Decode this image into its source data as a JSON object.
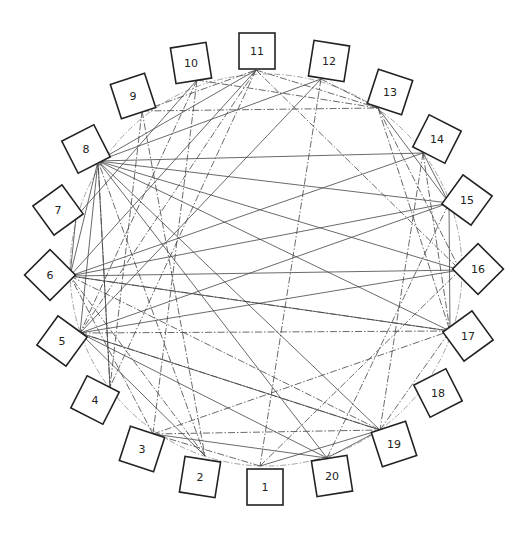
{
  "diagram": {
    "type": "circular-network",
    "colors": {
      "line": "#444444",
      "box_stroke": "#222222",
      "background": "#ffffff"
    },
    "center": [
      266,
      270
    ],
    "radius": 196,
    "nodes": [
      {
        "id": "1",
        "label": "1",
        "anchor": [
          260,
          466
        ],
        "box": [
          265,
          487
        ],
        "rot": 0
      },
      {
        "id": "2",
        "label": "2",
        "anchor": [
          205,
          456
        ],
        "box": [
          200,
          477
        ],
        "rot": 18
      },
      {
        "id": "3",
        "label": "3",
        "anchor": [
          153,
          434
        ],
        "box": [
          142,
          449
        ],
        "rot": 36
      },
      {
        "id": "4",
        "label": "4",
        "anchor": [
          110,
          387
        ],
        "box": [
          95,
          400
        ],
        "rot": 54
      },
      {
        "id": "5",
        "label": "5",
        "anchor": [
          80,
          333
        ],
        "box": [
          62,
          341
        ],
        "rot": 72
      },
      {
        "id": "6",
        "label": "6",
        "anchor": [
          70,
          276
        ],
        "box": [
          50,
          275
        ],
        "rot": 90
      },
      {
        "id": "7",
        "label": "7",
        "anchor": [
          76,
          217
        ],
        "box": [
          58,
          210
        ],
        "rot": 108
      },
      {
        "id": "8",
        "label": "8",
        "anchor": [
          98,
          161
        ],
        "box": [
          86,
          149
        ],
        "rot": 126
      },
      {
        "id": "9",
        "label": "9",
        "anchor": [
          142,
          111
        ],
        "box": [
          133,
          96
        ],
        "rot": 144
      },
      {
        "id": "10",
        "label": "10",
        "anchor": [
          197,
          80
        ],
        "box": [
          191,
          63
        ],
        "rot": 162
      },
      {
        "id": "11",
        "label": "11",
        "anchor": [
          256,
          70
        ],
        "box": [
          257,
          51
        ],
        "rot": 180
      },
      {
        "id": "12",
        "label": "12",
        "anchor": [
          321,
          79
        ],
        "box": [
          329,
          61
        ],
        "rot": 198
      },
      {
        "id": "13",
        "label": "13",
        "anchor": [
          378,
          108
        ],
        "box": [
          390,
          92
        ],
        "rot": 216
      },
      {
        "id": "14",
        "label": "14",
        "anchor": [
          423,
          153
        ],
        "box": [
          437,
          139
        ],
        "rot": 234
      },
      {
        "id": "15",
        "label": "15",
        "anchor": [
          449,
          203
        ],
        "box": [
          467,
          200
        ],
        "rot": 252
      },
      {
        "id": "16",
        "label": "16",
        "anchor": [
          460,
          270
        ],
        "box": [
          478,
          269
        ],
        "rot": 270
      },
      {
        "id": "17",
        "label": "17",
        "anchor": [
          450,
          331
        ],
        "box": [
          468,
          336
        ],
        "rot": 288
      },
      {
        "id": "18",
        "label": "18",
        "anchor": [
          421,
          386
        ],
        "box": [
          438,
          393
        ],
        "rot": 306
      },
      {
        "id": "19",
        "label": "19",
        "anchor": [
          380,
          430
        ],
        "box": [
          394,
          444
        ],
        "rot": 324
      },
      {
        "id": "20",
        "label": "20",
        "anchor": [
          327,
          458
        ],
        "box": [
          332,
          476
        ],
        "rot": 342
      }
    ],
    "edges_solid": [
      [
        "8",
        "15"
      ],
      [
        "8",
        "16"
      ],
      [
        "8",
        "17"
      ],
      [
        "8",
        "14"
      ],
      [
        "8",
        "19"
      ],
      [
        "8",
        "20"
      ],
      [
        "8",
        "12"
      ],
      [
        "8",
        "11"
      ],
      [
        "8",
        "4"
      ],
      [
        "8",
        "5"
      ],
      [
        "8",
        "6"
      ],
      [
        "6",
        "15"
      ],
      [
        "6",
        "16"
      ],
      [
        "6",
        "17"
      ],
      [
        "6",
        "14"
      ],
      [
        "6",
        "11"
      ],
      [
        "6",
        "7"
      ],
      [
        "5",
        "15"
      ],
      [
        "5",
        "16"
      ],
      [
        "5",
        "19"
      ],
      [
        "5",
        "20"
      ],
      [
        "5",
        "12"
      ],
      [
        "13",
        "15"
      ],
      [
        "14",
        "15"
      ],
      [
        "15",
        "17"
      ],
      [
        "1",
        "19"
      ],
      [
        "20",
        "19"
      ],
      [
        "3",
        "20"
      ],
      [
        "7",
        "10"
      ],
      [
        "2",
        "5"
      ]
    ],
    "edges_dashdot": [
      [
        "9",
        "13"
      ],
      [
        "9",
        "11"
      ],
      [
        "9",
        "2"
      ],
      [
        "9",
        "4"
      ],
      [
        "10",
        "13"
      ],
      [
        "10",
        "3"
      ],
      [
        "10",
        "5"
      ],
      [
        "11",
        "13"
      ],
      [
        "11",
        "4"
      ],
      [
        "11",
        "16"
      ],
      [
        "11",
        "5"
      ],
      [
        "12",
        "13"
      ],
      [
        "12",
        "1"
      ],
      [
        "13",
        "17"
      ],
      [
        "13",
        "16"
      ],
      [
        "14",
        "17"
      ],
      [
        "14",
        "19"
      ],
      [
        "5",
        "17"
      ],
      [
        "6",
        "17"
      ],
      [
        "6",
        "19"
      ],
      [
        "5",
        "19"
      ],
      [
        "3",
        "19"
      ],
      [
        "3",
        "17"
      ],
      [
        "1",
        "3"
      ],
      [
        "1",
        "16"
      ],
      [
        "20",
        "15"
      ],
      [
        "19",
        "17"
      ],
      [
        "2",
        "8"
      ],
      [
        "4",
        "8"
      ],
      [
        "3",
        "6"
      ],
      [
        "2",
        "6"
      ]
    ]
  }
}
